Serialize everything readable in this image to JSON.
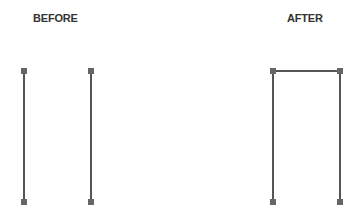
{
  "labels": {
    "before": "BEFORE",
    "after": "AFTER"
  },
  "colors": {
    "line": "#555555",
    "handle": "#666666",
    "text": "#333333"
  },
  "before": {
    "segments": [
      {
        "x1": 24,
        "y1": 71,
        "x2": 24,
        "y2": 202
      },
      {
        "x1": 91,
        "y1": 71,
        "x2": 91,
        "y2": 202
      }
    ]
  },
  "after": {
    "segments": [
      {
        "x1": 273,
        "y1": 71,
        "x2": 273,
        "y2": 202
      },
      {
        "x1": 340,
        "y1": 71,
        "x2": 340,
        "y2": 202
      },
      {
        "x1": 273,
        "y1": 71,
        "x2": 340,
        "y2": 71
      }
    ]
  }
}
